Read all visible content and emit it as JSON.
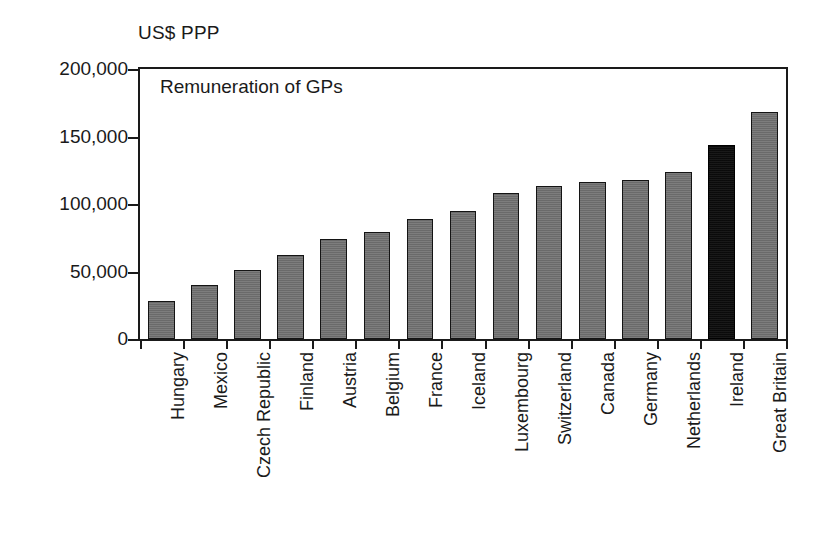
{
  "unit_label": "US$ PPP",
  "chart_data": {
    "type": "bar",
    "title": "Remuneration of GPs",
    "xlabel": "",
    "ylabel": "US$ PPP",
    "ylim": [
      0,
      200000
    ],
    "yticks": [
      0,
      50000,
      100000,
      150000,
      200000
    ],
    "ytick_labels": [
      "0",
      "50,000",
      "100,000",
      "150,000",
      "200,000"
    ],
    "grid": false,
    "legend": "none",
    "categories": [
      "Hungary",
      "Mexico",
      "Czech Republic",
      "Finland",
      "Austria",
      "Belgium",
      "France",
      "Iceland",
      "Luxembourg",
      "Switzerland",
      "Canada",
      "Germany",
      "Netherlands",
      "Ireland",
      "Great Britain"
    ],
    "values": [
      28000,
      40000,
      51000,
      62000,
      74000,
      79000,
      89000,
      95000,
      108000,
      113000,
      116000,
      118000,
      124000,
      144000,
      168000
    ],
    "highlight_category": "Ireland",
    "colors": {
      "bar": "#6e6e6e",
      "bar_highlight": "#0d0d0d",
      "bar_outline": "#141414",
      "axis": "#1a1a1a",
      "background": "#ffffff"
    }
  }
}
